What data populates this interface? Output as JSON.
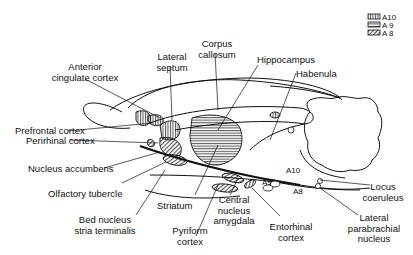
{
  "diagram": {
    "legend": [
      {
        "key": "A10",
        "label": "A10",
        "pattern": "vertical-stripes"
      },
      {
        "key": "A9",
        "label": "A 9",
        "pattern": "horizontal-stripes"
      },
      {
        "key": "A8",
        "label": "A 8",
        "pattern": "diagonal-hatch"
      }
    ],
    "labels": {
      "anterior_cingulate_1": "Anterior",
      "anterior_cingulate_2": "cingulate cortex",
      "lateral_septum_1": "Lateral",
      "lateral_septum_2": "septum",
      "corpus_callosum_1": "Corpus",
      "corpus_callosum_2": "callosum",
      "hippocampus": "Hippocampus",
      "habenula": "Habenula",
      "prefrontal_cortex": "Prefrontal cortex",
      "perirhinal_cortex": "Perirhinal cortex",
      "nucleus_accumbens": "Nucleus accumbens",
      "olfactory_tubercle": "Olfactory tubercle",
      "bed_nucleus_1": "Bed nucleus",
      "bed_nucleus_2": "stria terminalis",
      "striatum": "Striatum",
      "central_nucleus_1": "Central",
      "central_nucleus_2": "nucleus",
      "central_nucleus_3": "amygdala",
      "pyriform_1": "Pyriform",
      "pyriform_2": "cortex",
      "entorhinal_1": "Entorhinal",
      "entorhinal_2": "cortex",
      "locus_1": "Locus",
      "locus_2": "coeruleus",
      "parabrachial_1": "Lateral",
      "parabrachial_2": "parabrachial",
      "parabrachial_3": "nucleus",
      "a10_cell": "A10",
      "a9_cell": "A9",
      "a8_cell": "A8"
    }
  }
}
